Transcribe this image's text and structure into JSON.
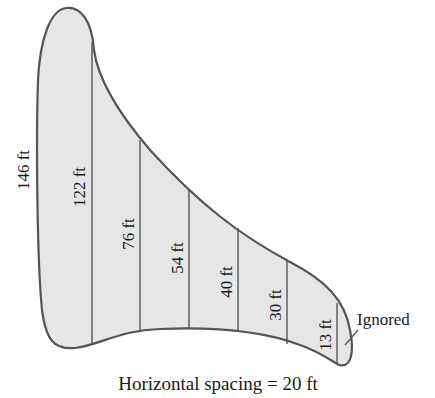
{
  "diagram": {
    "caption": "Horizontal spacing = 20 ft",
    "measurements": [
      {
        "label": "146 ft",
        "value": 146
      },
      {
        "label": "122 ft",
        "value": 122
      },
      {
        "label": "76 ft",
        "value": 76
      },
      {
        "label": "54 ft",
        "value": 54
      },
      {
        "label": "40 ft",
        "value": 40
      },
      {
        "label": "30 ft",
        "value": 30
      },
      {
        "label": "13 ft",
        "value": 13
      }
    ],
    "ignored_label": "Ignored",
    "fill_color": "#e6e6e6",
    "outline_color": "#555555"
  }
}
